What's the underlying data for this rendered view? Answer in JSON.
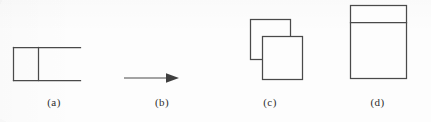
{
  "figure": {
    "background_color": "#fdfdfd",
    "line_color": "#4a4a4a",
    "caption_color": "#2e2e2e",
    "panels": [
      {
        "id": "a",
        "caption": "(a)",
        "shape_name": "open-ended-rectangle-with-vertical-divider",
        "description": "Closed square on the left with a vertical divider line; top and bottom horizontal lines continue to the right with no closing right edge"
      },
      {
        "id": "b",
        "caption": "(b)",
        "shape_name": "rightward-arrow",
        "description": "Horizontal arrow pointing to the right with a solid triangular head"
      },
      {
        "id": "c",
        "caption": "(c)",
        "shape_name": "two-overlapping-squares",
        "description": "Two equal squares, the front one offset down and to the right, occluding the back square"
      },
      {
        "id": "d",
        "caption": "(d)",
        "shape_name": "square-with-horizontal-divider",
        "description": "Large square divided by a horizontal line near the top, forming a narrow upper band and a large lower region"
      }
    ]
  }
}
